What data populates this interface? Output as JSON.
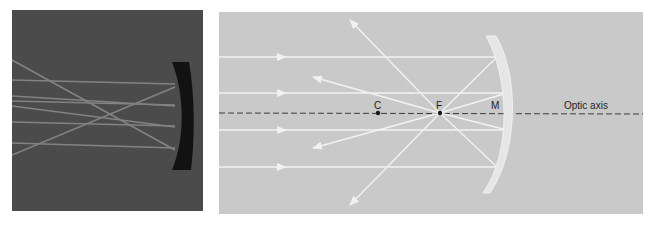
{
  "photo": {
    "description": "Photograph of parallel light rays reflecting off a concave mirror and converging",
    "background_color": "#4b4b4b",
    "mirror_color": "#111111",
    "ray_color": "#8a8a8a"
  },
  "diagram": {
    "background_color": "#c9c9c9",
    "ray_color": "#f2f2f2",
    "axis_color": "#333333",
    "labels": {
      "center": "C",
      "focus": "F",
      "mirror": "M",
      "axis": "Optic axis"
    },
    "points": {
      "C": [
        378,
        113
      ],
      "F": [
        440,
        113
      ]
    },
    "incoming_rays_y": [
      57,
      93,
      130,
      167
    ],
    "reflected_ray_ends": [
      [
        350,
        20
      ],
      [
        313,
        77
      ],
      [
        313,
        148
      ],
      [
        350,
        205
      ]
    ]
  }
}
